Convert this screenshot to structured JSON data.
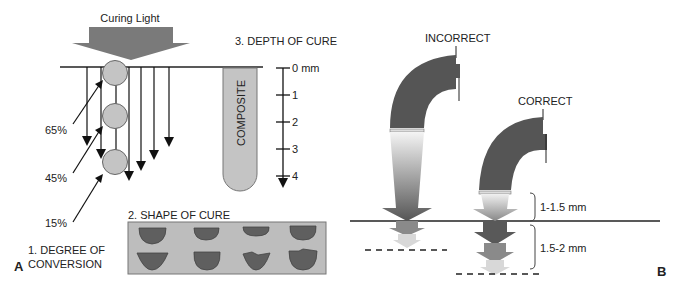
{
  "panel_a": {
    "panel_label": "A",
    "curing_light_label": "Curing  Light",
    "depth_title": "3. DEPTH OF CURE",
    "composite_label": "COMPOSITE",
    "scale_ticks": [
      "0 mm",
      "1",
      "2",
      "3",
      "4"
    ],
    "conversion_labels": [
      "65%",
      "45%",
      "15%"
    ],
    "degree_label_line1": "1. DEGREE OF",
    "degree_label_line2": "CONVERSION",
    "shape_title": "2. SHAPE OF CURE"
  },
  "panel_b": {
    "panel_label": "B",
    "incorrect_label": "INCORRECT",
    "correct_label": "CORRECT",
    "distance_label": "1-1.5 mm",
    "depth_label": "1.5-2 mm"
  },
  "colors": {
    "dark_gray": "#595959",
    "mid_gray": "#8a8a8a",
    "light_gray": "#c8c8c8",
    "panel_bg": "#bdbdbd"
  }
}
